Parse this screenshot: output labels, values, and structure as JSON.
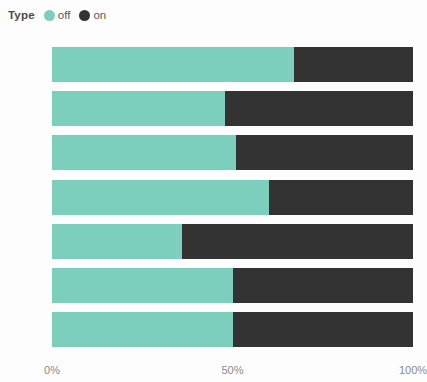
{
  "legend": {
    "title": "Type",
    "entries": [
      {
        "label": "off",
        "color": "#7CCFBC",
        "marker": "circle"
      },
      {
        "label": "on",
        "color": "#333333",
        "marker": "circle"
      }
    ]
  },
  "axis": {
    "x_ticks": [
      "0%",
      "50%",
      "100%"
    ],
    "x_tick_values": [
      0,
      50,
      100
    ]
  },
  "colors": {
    "off": "#7CCFBC",
    "on": "#333333",
    "text": "#6b6b6b",
    "tick_text": "#8a8a8a",
    "background": "#fdfdfd"
  },
  "chart_data": {
    "type": "bar",
    "orientation": "horizontal",
    "stacked": true,
    "normalized": true,
    "title": "",
    "xlabel": "",
    "ylabel": "",
    "legend_title": "Type",
    "legend_position": "top-left",
    "grid": false,
    "xlim": [
      0,
      100
    ],
    "x_tick_labels": [
      "0%",
      "50%",
      "100%"
    ],
    "categories": [
      "Sat",
      "Tue",
      "Fri",
      "Mon",
      "Wed",
      "Thu",
      "Sun"
    ],
    "series": [
      {
        "name": "off",
        "color": "#7CCFBC",
        "values": [
          67,
          48,
          51,
          60,
          36,
          50,
          50
        ]
      },
      {
        "name": "on",
        "color": "#333333",
        "values": [
          33,
          52,
          49,
          40,
          64,
          50,
          50
        ]
      }
    ]
  }
}
